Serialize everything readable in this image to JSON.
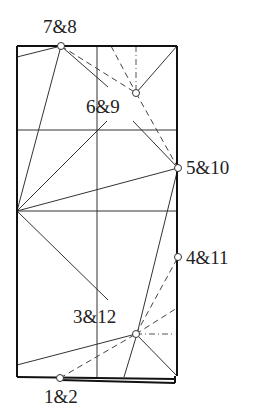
{
  "diagram": {
    "type": "origami crease pattern",
    "labels": [
      {
        "id": "p78",
        "text": "7&8"
      },
      {
        "id": "p69",
        "text": "6&9"
      },
      {
        "id": "p510",
        "text": "5&10"
      },
      {
        "id": "p411",
        "text": "4&11"
      },
      {
        "id": "p312",
        "text": "3&12"
      },
      {
        "id": "p12",
        "text": "1&2"
      }
    ],
    "line_styles": [
      "solid (crease)",
      "dashed (valley)",
      "dash-dot (mountain)"
    ]
  }
}
